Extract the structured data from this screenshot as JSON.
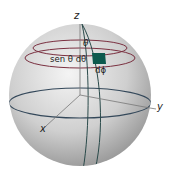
{
  "diagram": {
    "type": "spherical surface element",
    "axes": {
      "z": "z",
      "y": "y",
      "x": "x"
    },
    "labels": {
      "theta": "θ",
      "sen_theta_dtheta": "sen θ dθ",
      "dphi": "dϕ"
    },
    "colors": {
      "sphere_light": "#f2f2f2",
      "sphere_dark": "#8e8e8e",
      "latitude_circles": "#7a3040",
      "meridians": "#2a4a4a",
      "equator": "#34485a",
      "patch": "#0d5a4e",
      "axes": "#555555"
    }
  }
}
